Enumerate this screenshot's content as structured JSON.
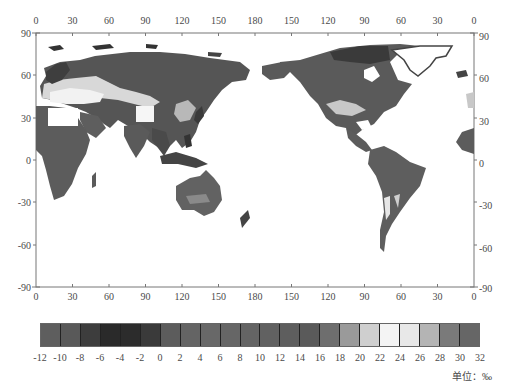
{
  "map": {
    "top_lon_labels": [
      "0",
      "30",
      "60",
      "90",
      "120",
      "150",
      "180",
      "150",
      "120",
      "90",
      "60",
      "30",
      "0"
    ],
    "bottom_lon_labels": [
      "0",
      "30",
      "60",
      "90",
      "120",
      "150",
      "180",
      "150",
      "120",
      "90",
      "60",
      "30",
      "0"
    ],
    "left_lat_labels": [
      "90",
      "60",
      "30",
      "0",
      "-30",
      "-60",
      "-90"
    ],
    "right_lat_labels": [
      "90",
      "60",
      "30",
      "0",
      "-30",
      "-60",
      "-90"
    ],
    "frame": {
      "left": 36,
      "right": 474,
      "top": 33,
      "bottom": 287
    },
    "projection": "Pacific-centered equirectangular (0°E → 180° → 0°)"
  },
  "colorbar": {
    "tick_labels": [
      "-12",
      "-10",
      "-8",
      "-6",
      "-4",
      "-2",
      "0",
      "2",
      "4",
      "6",
      "8",
      "10",
      "12",
      "14",
      "16",
      "18",
      "20",
      "22",
      "24",
      "26",
      "28",
      "30",
      "32"
    ],
    "bin_colors": [
      "#5e5e5e",
      "#595959",
      "#3d3d3d",
      "#2a2a2a",
      "#2c2c2c",
      "#3a3a3a",
      "#5c5c5c",
      "#646464",
      "#686868",
      "#666666",
      "#646464",
      "#616161",
      "#5e5e5e",
      "#5a5a5a",
      "#6e6e6e",
      "#9a9a9a",
      "#cfcfcf",
      "#f4f4f4",
      "#e8e8e8",
      "#b4b4b4",
      "#7a7a7a",
      "#666666"
    ],
    "unit_label": "单位：‰"
  },
  "chart_data": {
    "type": "heatmap",
    "title": "",
    "xlabel": "Longitude",
    "ylabel": "Latitude",
    "x_ticks": [
      "0",
      "30",
      "60",
      "90",
      "120",
      "150",
      "180",
      "150",
      "120",
      "90",
      "60",
      "30",
      "0"
    ],
    "y_ticks": [
      90,
      60,
      30,
      0,
      -30,
      -60,
      -90
    ],
    "xlim": [
      0,
      360
    ],
    "ylim": [
      -90,
      90
    ],
    "colorbar": {
      "min": -12,
      "max": 32,
      "step": 2,
      "unit": "‰"
    },
    "regions": [
      {
        "name": "Siberia / N. Asia",
        "approx_value": 4
      },
      {
        "name": "Europe / Central Asia",
        "approx_value": 20
      },
      {
        "name": "Tibetan Plateau",
        "approx_value": 24
      },
      {
        "name": "Sahara (no data)",
        "approx_value": null
      },
      {
        "name": "Africa (sub-Saharan)",
        "approx_value": 8
      },
      {
        "name": "South & SE Asia",
        "approx_value": 6
      },
      {
        "name": "Australia",
        "approx_value": 10
      },
      {
        "name": "North America",
        "approx_value": 8
      },
      {
        "name": "US Southwest / Mexico",
        "approx_value": 18
      },
      {
        "name": "Canadian Arctic",
        "approx_value": -4
      },
      {
        "name": "Greenland (no data)",
        "approx_value": null
      },
      {
        "name": "South America",
        "approx_value": 10
      },
      {
        "name": "Andes",
        "approx_value": 22
      }
    ]
  }
}
